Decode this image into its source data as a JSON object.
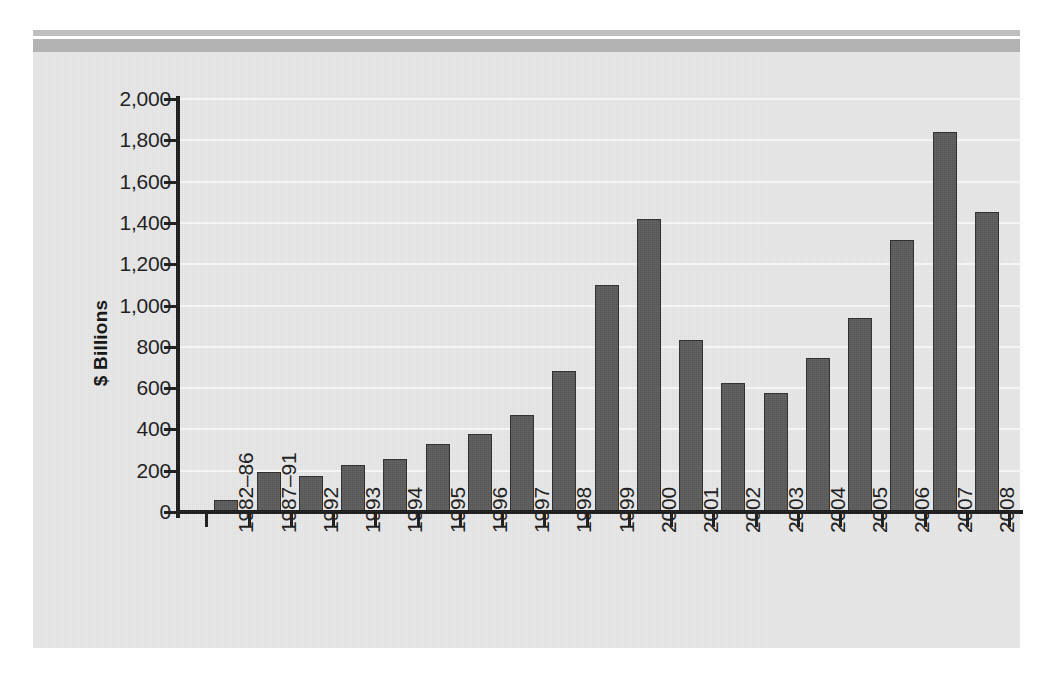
{
  "figure": {
    "background_color": "#e6e6e6",
    "bar_color": "#595959",
    "bar_border_color": "#2b2b2b",
    "gridline_color": "#f7f7f7",
    "axis_color": "#1a1a1a",
    "header_rule_thin_color": "#bfbfbf",
    "header_rule_thick_color": "#b3b3b3"
  },
  "chart_data": {
    "type": "bar",
    "title": "",
    "xlabel": "",
    "ylabel": "$ Billions",
    "ylim": [
      0,
      2000
    ],
    "ytick_values": [
      0,
      200,
      400,
      600,
      800,
      1000,
      1200,
      1400,
      1600,
      1800,
      2000
    ],
    "ytick_labels": [
      "0",
      "200",
      "400",
      "600",
      "800",
      "1,000",
      "1,200",
      "1,400",
      "1,600",
      "1,800",
      "2,000"
    ],
    "grid": true,
    "legend": false,
    "categories": [
      "1982–86",
      "1987–91",
      "1992",
      "1993",
      "1994",
      "1995",
      "1996",
      "1997",
      "1998",
      "1999",
      "2000",
      "2001",
      "2002",
      "2003",
      "2004",
      "2005",
      "2006",
      "2007",
      "2008"
    ],
    "values": [
      60,
      195,
      175,
      230,
      255,
      330,
      380,
      470,
      685,
      1100,
      1420,
      835,
      625,
      575,
      745,
      940,
      1315,
      1840,
      1455
    ]
  }
}
